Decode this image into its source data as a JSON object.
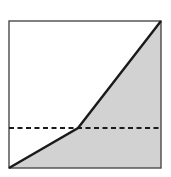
{
  "figure": {
    "kind": "geometry-diagram",
    "canvas": {
      "width": 171,
      "height": 177,
      "background": "#ffffff"
    },
    "colors": {
      "border": "#4a4a4a",
      "shade_fill": "#d2d2d2",
      "unshaded_fill": "#ffffff",
      "solid_line": "#1a1a1a",
      "dashed_line": "#1a1a1a"
    },
    "square": {
      "label": "bounding-square",
      "x": 9,
      "y": 21,
      "width": 152,
      "height": 147,
      "stroke_width": 1.4,
      "corners": {
        "top_left": [
          9,
          21
        ],
        "top_right": [
          161,
          21
        ],
        "bottom_right": [
          161,
          168
        ],
        "bottom_left": [
          9,
          168
        ]
      }
    },
    "piecewise_line": {
      "label": "piecewise-boundary",
      "stroke_width": 2.4,
      "points": [
        [
          9,
          168
        ],
        [
          78,
          128
        ],
        [
          161,
          21
        ]
      ],
      "segments": [
        {
          "name": "shallow-segment",
          "from": [
            9,
            168
          ],
          "to": [
            78,
            128
          ]
        },
        {
          "name": "steep-segment",
          "from": [
            78,
            128
          ],
          "to": [
            161,
            21
          ]
        }
      ]
    },
    "dashed_line": {
      "label": "horizontal-dashed-line",
      "y": 128,
      "x_start": 9,
      "x_end": 161,
      "stroke_width": 2.2,
      "dash_length": 5,
      "gap_length": 3.5
    },
    "bend_point": {
      "label": "vertex",
      "x": 78,
      "y": 128
    },
    "shaded_region": {
      "label": "shaded-area",
      "polygon": [
        [
          9,
          168
        ],
        [
          78,
          128
        ],
        [
          161,
          21
        ],
        [
          161,
          168
        ]
      ]
    },
    "unshaded_region": {
      "label": "unshaded-area",
      "polygon": [
        [
          9,
          21
        ],
        [
          161,
          21
        ],
        [
          78,
          128
        ],
        [
          9,
          168
        ]
      ]
    }
  },
  "chart_data": {
    "type": "line",
    "title": "",
    "xlabel": "",
    "ylabel": "",
    "grid": false,
    "legend": "none",
    "xlim": [
      0,
      1
    ],
    "ylim": [
      0,
      1
    ],
    "series": [
      {
        "name": "piecewise-line",
        "x": [
          0,
          0.454,
          1
        ],
        "y": [
          0,
          0.272,
          1
        ]
      },
      {
        "name": "horizontal-dashed-reference",
        "style": "dashed",
        "x": [
          0,
          1
        ],
        "y": [
          0.272,
          0.272
        ]
      }
    ],
    "annotations": [
      {
        "name": "shaded-region-below-curve",
        "fill": "#d2d2d2"
      }
    ]
  }
}
